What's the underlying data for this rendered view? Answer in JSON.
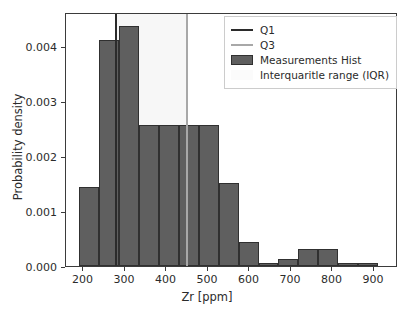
{
  "chart_data": {
    "type": "bar",
    "title": "",
    "subtitle": "",
    "xlabel": "Zr [ppm]",
    "ylabel": "Probability density",
    "xlim": [
      158,
      958
    ],
    "ylim": [
      0,
      0.00462
    ],
    "grid": false,
    "legend_position": "upper right",
    "bin_width": 48,
    "bin_edges": [
      190,
      238,
      286,
      334,
      382,
      430,
      478,
      526,
      574,
      622,
      670,
      718,
      766,
      814,
      862,
      910
    ],
    "categories": [
      "190-238",
      "238-286",
      "286-334",
      "334-382",
      "382-430",
      "430-478",
      "478-526",
      "526-574",
      "574-622",
      "622-670",
      "670-718",
      "718-766",
      "766-814",
      "814-862",
      "862-910"
    ],
    "values": [
      0.00144,
      0.00412,
      0.00437,
      0.00256,
      0.00256,
      0.00256,
      0.00256,
      0.00151,
      0.00043,
      6e-05,
      0.00012,
      0.00031,
      0.00031,
      6e-05,
      6e-05
    ],
    "series": [
      {
        "name": "Measurements Hist",
        "values": [
          0.00144,
          0.00412,
          0.00437,
          0.00256,
          0.00256,
          0.00256,
          0.00256,
          0.00151,
          0.00043,
          6e-05,
          0.00012,
          0.00031,
          0.00031,
          6e-05,
          6e-05
        ]
      }
    ],
    "xticks": [
      200,
      300,
      400,
      500,
      600,
      700,
      800,
      900
    ],
    "xticklabels": [
      "200",
      "300",
      "400",
      "500",
      "600",
      "700",
      "800",
      "900"
    ],
    "yticks": [
      0.0,
      0.001,
      0.002,
      0.003,
      0.004
    ],
    "yticklabels": [
      "0.000",
      "0.001",
      "0.002",
      "0.003",
      "0.004"
    ],
    "annotations": {
      "q1_value": 277,
      "q3_value": 448,
      "iqr_span": [
        277,
        448
      ]
    },
    "colors": {
      "bar_face": "#5f5f5f",
      "bar_edge": "#303030",
      "q1_line": "#2b2b2b",
      "q3_line": "#a8a8a8",
      "iqr_fill": "#f7f7f7",
      "axis": "#3b3b3b",
      "text": "#2b2b2b"
    }
  },
  "legend": {
    "entries": [
      {
        "label": "Q1",
        "key": "line-dark"
      },
      {
        "label": "Q3",
        "key": "line-light"
      },
      {
        "label": "Measurements Hist",
        "key": "patch-bar"
      },
      {
        "label": "Interquaritle range (IQR)",
        "key": "patch-iqr"
      }
    ]
  }
}
